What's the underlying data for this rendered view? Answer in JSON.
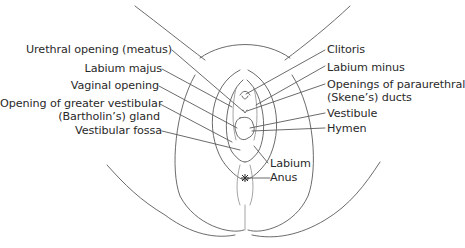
{
  "figure": {
    "line_color": "#555555",
    "text_color": "#2a2a2a",
    "background": "#ffffff"
  },
  "labels_left": [
    {
      "id": "urethral-opening",
      "text": "Urethral opening (meatus)"
    },
    {
      "id": "labium-majus",
      "text": "Labium majus"
    },
    {
      "id": "vaginal-opening",
      "text": "Vaginal opening"
    },
    {
      "id": "greater-vestibular-gland",
      "line1": "Opening of greater vestibular",
      "line2": "(Bartholin’s) gland"
    },
    {
      "id": "vestibular-fossa",
      "text": "Vestibular fossa"
    }
  ],
  "labels_right": [
    {
      "id": "clitoris",
      "text": "Clitoris"
    },
    {
      "id": "labium-minus",
      "text": "Labium minus"
    },
    {
      "id": "paraurethral-ducts",
      "line1": "Openings of paraurethral",
      "line2": "(Skene’s) ducts"
    },
    {
      "id": "vestibule",
      "text": "Vestibule"
    },
    {
      "id": "hymen",
      "text": "Hymen"
    }
  ],
  "labels_bottom": [
    {
      "id": "labium",
      "text": "Labium"
    },
    {
      "id": "anus",
      "text": "Anus"
    }
  ]
}
